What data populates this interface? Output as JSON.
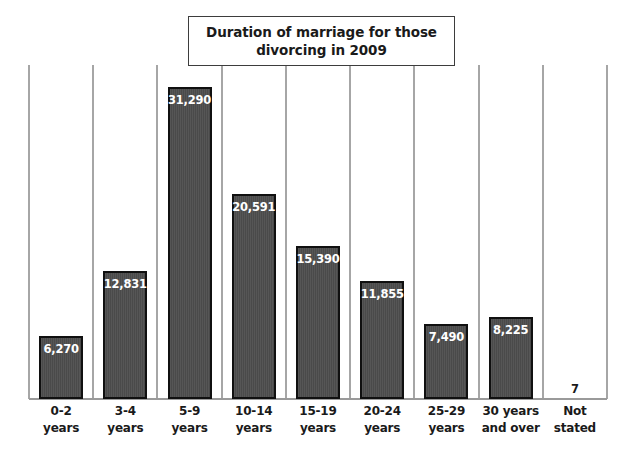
{
  "chart_data": {
    "type": "bar",
    "title": "Duration of marriage for those divorcing in 2009",
    "title_lines": [
      "Duration of marriage for those",
      "divorcing in 2009"
    ],
    "xlabel": "",
    "ylabel": "",
    "ylim": [
      0,
      33500
    ],
    "grid": "vertical category separators only",
    "legend": "none",
    "orientation": "vertical",
    "categories": [
      "0-2 years",
      "3-4 years",
      "5-9 years",
      "10-14 years",
      "15-19 years",
      "20-24 years",
      "25-29 years",
      "30 years and over",
      "Not stated"
    ],
    "category_lines": [
      [
        "0-2",
        "years"
      ],
      [
        "3-4",
        "years"
      ],
      [
        "5-9",
        "years"
      ],
      [
        "10-14",
        "years"
      ],
      [
        "15-19",
        "years"
      ],
      [
        "20-24",
        "years"
      ],
      [
        "25-29",
        "years"
      ],
      [
        "30 years",
        "and over"
      ],
      [
        "Not",
        "stated"
      ]
    ],
    "values": [
      6270,
      12831,
      31290,
      20591,
      15390,
      11855,
      7490,
      8225,
      7
    ],
    "value_labels": [
      "6,270",
      "12,831",
      "31,290",
      "20,591",
      "15,390",
      "11,855",
      "7,490",
      "8,225",
      "7"
    ],
    "colors": {
      "bar_fill": "#4d4d4d",
      "bar_border": "#101010",
      "value_label_inside": "#ffffff",
      "value_label_outside": "#1a1a1a",
      "gridline": "#a6a6a6",
      "baseline": "#9a9a9a",
      "background": "#ffffff",
      "title_border": "#3d3d3d",
      "axis_label": "#1a1a1a"
    }
  }
}
